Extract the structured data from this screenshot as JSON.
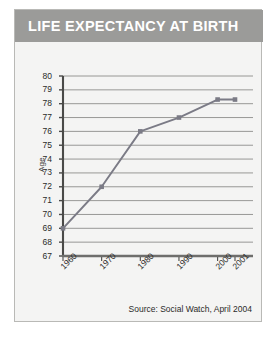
{
  "card": {
    "title": "LIFE EXPECTANCY AT BIRTH",
    "source": "Source: Social Watch, April 2004"
  },
  "colors": {
    "title_band": "#9b9b99",
    "title_text": "#ffffff",
    "card_background": "#f4f4f3",
    "card_border": "#b9b9b6",
    "gridline": "#8d8d8b",
    "axis": "#4a4a48",
    "series_line": "#7b7b86",
    "series_marker": "#7b7b86",
    "tick_text": "#2b2b29"
  },
  "chart_data": {
    "type": "line",
    "title": "LIFE EXPECTANCY AT BIRTH",
    "xlabel": "",
    "ylabel": "Age",
    "x": [
      "1960",
      "1970",
      "1980",
      "1990",
      "2000",
      "2001"
    ],
    "values": [
      69,
      72,
      76,
      77,
      78.3,
      78.3
    ],
    "ylim": [
      67,
      80
    ],
    "yticks": [
      80,
      79,
      78,
      77,
      76,
      75,
      74,
      73,
      72,
      71,
      70,
      69,
      68,
      67
    ],
    "ytick_labels": [
      "80",
      "79",
      "78",
      "77",
      "76",
      "75",
      "74",
      "73",
      "72",
      "71",
      "70",
      "69",
      "68",
      "67"
    ],
    "xtick_labels": [
      "1960",
      "1970",
      "1980",
      "1990",
      "2000",
      "2001"
    ],
    "grid": true,
    "grid_orientation": "horizontal",
    "legend": "none",
    "markers": true,
    "annotations": [
      "Source: Social Watch, April 2004"
    ]
  }
}
